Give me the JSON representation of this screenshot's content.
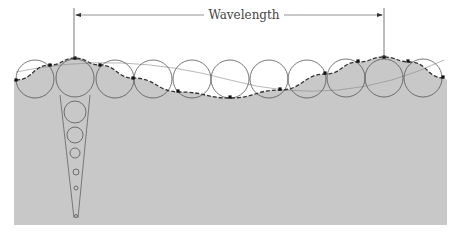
{
  "diagram": {
    "title_label": "Wavelength",
    "colors": {
      "background": "#ffffff",
      "water": "#c8c8c8",
      "line": "#555555",
      "dot": "#111111"
    },
    "wavelength_marker": {
      "left_x": 74,
      "right_x": 384,
      "y": 15
    },
    "orbit_circles": [
      {
        "cx": 35,
        "cy": 79,
        "r": 19
      },
      {
        "cx": 75,
        "cy": 78,
        "r": 19
      },
      {
        "cx": 115,
        "cy": 79,
        "r": 19
      },
      {
        "cx": 153,
        "cy": 79,
        "r": 19
      },
      {
        "cx": 192,
        "cy": 79,
        "r": 19
      },
      {
        "cx": 230,
        "cy": 79,
        "r": 19
      },
      {
        "cx": 269,
        "cy": 79,
        "r": 19
      },
      {
        "cx": 307,
        "cy": 79,
        "r": 19
      },
      {
        "cx": 346,
        "cy": 78,
        "r": 19
      },
      {
        "cx": 384,
        "cy": 78,
        "r": 19
      },
      {
        "cx": 423,
        "cy": 78,
        "r": 19
      }
    ],
    "depth_circles": [
      {
        "cx": 75,
        "cy": 112,
        "r": 11
      },
      {
        "cx": 75,
        "cy": 135,
        "r": 8
      },
      {
        "cx": 75,
        "cy": 153,
        "r": 5
      },
      {
        "cx": 76,
        "cy": 172,
        "r": 3
      },
      {
        "cx": 76,
        "cy": 188,
        "r": 2
      },
      {
        "cx": 76,
        "cy": 216,
        "r": 1.5
      }
    ],
    "surface_points": [
      [
        16,
        80
      ],
      [
        50,
        65
      ],
      [
        75,
        58
      ],
      [
        100,
        65
      ],
      [
        133,
        78
      ],
      [
        180,
        92
      ],
      [
        230,
        98
      ],
      [
        280,
        90
      ],
      [
        326,
        74
      ],
      [
        358,
        62
      ],
      [
        384,
        57
      ],
      [
        410,
        62
      ],
      [
        444,
        78
      ]
    ],
    "particle_dots": [
      [
        16,
        80
      ],
      [
        50,
        65
      ],
      [
        75,
        58
      ],
      [
        100,
        65
      ],
      [
        133,
        78
      ],
      [
        178,
        91
      ],
      [
        230,
        97
      ],
      [
        280,
        89
      ],
      [
        325,
        73
      ],
      [
        358,
        61
      ],
      [
        384,
        57
      ],
      [
        408,
        61
      ],
      [
        443,
        77
      ]
    ]
  }
}
